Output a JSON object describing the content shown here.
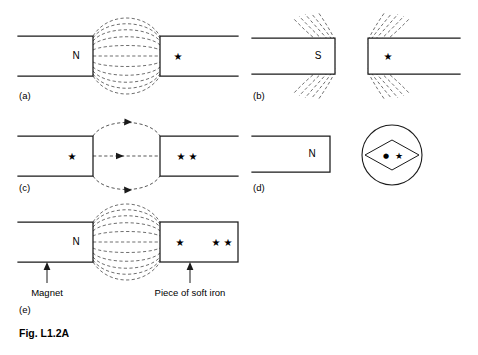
{
  "figure": {
    "caption": "Fig. L1.2A",
    "background_color": "#ffffff",
    "line_color": "#1a1a1a",
    "fieldline_color": "#555555"
  },
  "panels": [
    {
      "label": "(a)",
      "description": "Magnet N pole facing starred bar, field lines bulge across gap",
      "left_bar": {
        "pole_label": "N",
        "open_left": true
      },
      "right_bar": {
        "star_marks": "★",
        "star_count": 1,
        "open_right": true
      },
      "field": {
        "style": "bulging-ellipse",
        "count": 9,
        "arrows": false
      }
    },
    {
      "label": "(b)",
      "description": "Magnet S pole facing starred bar, field lines splay away from gap",
      "left_bar": {
        "pole_label": "S",
        "open_left": true
      },
      "right_bar": {
        "star_marks": "★",
        "star_count": 1,
        "open_right": true
      },
      "field": {
        "style": "repelling-splay",
        "count": 10,
        "arrows": false
      }
    },
    {
      "label": "(c)",
      "description": "Starred bar facing double-starred bar, dashed field lines with arrowheads",
      "left_bar": {
        "star_marks": "★",
        "star_count": 1,
        "open_left": true
      },
      "right_bar": {
        "star_marks": "★ ★",
        "star_count": 2,
        "open_right": true
      },
      "field": {
        "style": "three-line-loop",
        "count": 3,
        "arrows": true
      }
    },
    {
      "label": "(d)",
      "description": "Magnet with N pole and a separate compass showing needle with dot and star",
      "left_bar": {
        "pole_label": "N",
        "open_left": true
      },
      "compass": {
        "dot": "●",
        "star": "★",
        "shape": "rhombus-needle-in-circle"
      }
    },
    {
      "label": "(e)",
      "description": "Magnet N pole touching a piece of soft iron, field lines bridge the contact",
      "left_bar": {
        "pole_label": "N",
        "open_left": true,
        "annotation": "Magnet"
      },
      "right_bar": {
        "star_left": "★",
        "star_right": "★ ★",
        "annotation": "Piece of soft iron",
        "closed": true
      },
      "field": {
        "style": "bulging-ellipse",
        "count": 9,
        "arrows": false
      }
    }
  ],
  "annotations": {
    "magnet": "Magnet",
    "soft_iron": "Piece of soft iron"
  },
  "pole_labels": {
    "north": "N",
    "south": "S"
  },
  "glyphs": {
    "star": "★",
    "dot": "●"
  }
}
